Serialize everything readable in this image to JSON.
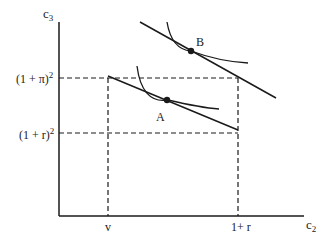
{
  "diagram": {
    "axes": {
      "y_label": "c",
      "y_label_sub": "3",
      "x_label": "c",
      "x_label_sub": "2"
    },
    "y_ticks": {
      "upper": "(1 + π)",
      "upper_sup": "2",
      "lower": "(1 + r)",
      "lower_sup": "2"
    },
    "x_ticks": {
      "left": "v",
      "right": "1+ r"
    },
    "points": {
      "a": "A",
      "b": "B"
    },
    "colors": {
      "line": "#1a1a1a",
      "background": "#ffffff"
    }
  }
}
